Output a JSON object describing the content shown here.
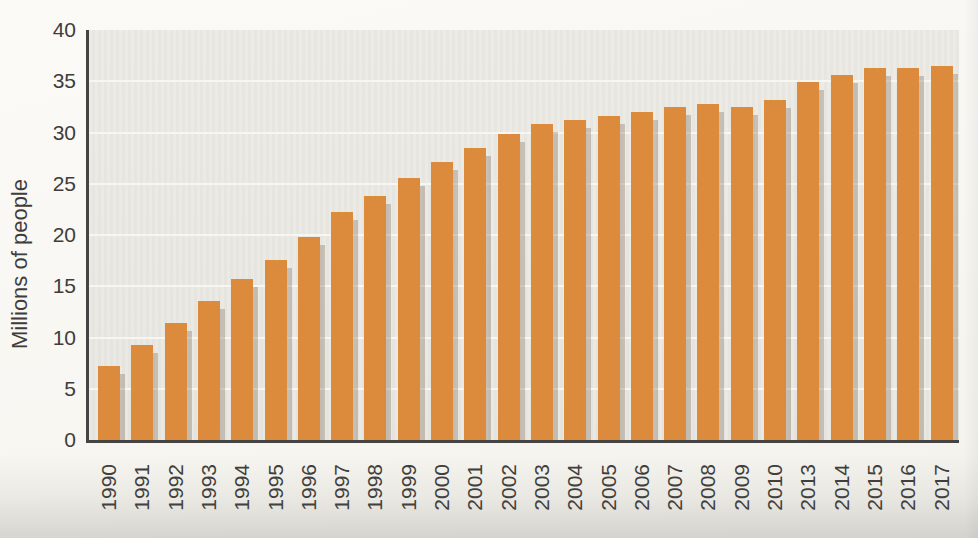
{
  "chart_data": {
    "type": "bar",
    "title": "",
    "xlabel": "",
    "ylabel": "Millions of people",
    "categories": [
      "1990",
      "1991",
      "1992",
      "1993",
      "1994",
      "1995",
      "1996",
      "1997",
      "1998",
      "1999",
      "2000",
      "2001",
      "2002",
      "2003",
      "2004",
      "2005",
      "2006",
      "2007",
      "2008",
      "2009",
      "2010",
      "2013",
      "2014",
      "2015",
      "2016",
      "2017"
    ],
    "values": [
      7.2,
      9.3,
      11.4,
      13.6,
      15.7,
      17.6,
      19.8,
      22.2,
      23.8,
      25.6,
      27.1,
      28.5,
      29.9,
      30.8,
      31.2,
      31.6,
      32.0,
      32.5,
      32.8,
      32.5,
      33.2,
      34.9,
      35.6,
      36.3,
      36.3,
      36.5
    ],
    "ylim": [
      0,
      40
    ],
    "yticks": [
      0,
      5,
      10,
      15,
      20,
      25,
      30,
      35,
      40
    ],
    "grid": "horizontal",
    "legend": "none",
    "x_tick_rotation_degrees": 90,
    "colors": {
      "bar": "#dc8b3d",
      "plot_background": "#e9e8e2",
      "gridline": "#f7f6f2",
      "axis": "#454442",
      "text": "#3e3d3b",
      "page_background": "#f7f6f1"
    }
  }
}
